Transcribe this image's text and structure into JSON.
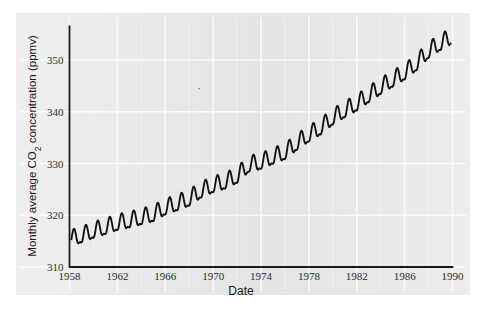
{
  "figure": {
    "background_color": "#e8e8e8",
    "page_color": "#ffffff",
    "line_color": "#111111",
    "grid_color": "#fbfbfb",
    "axis_color": "#1a1a1a"
  },
  "chart_data": {
    "type": "line",
    "title": "",
    "xlabel": "Date",
    "ylabel": "Monthly average CO₂ concentration (ppmv)",
    "ylabel_parts": {
      "pre": "Monthly average CO",
      "sub": "2",
      "post": " concentration (ppmv)"
    },
    "xlim": [
      1958,
      1990
    ],
    "ylim": [
      310,
      356
    ],
    "xticks": [
      1958,
      1962,
      1966,
      1970,
      1974,
      1978,
      1982,
      1986,
      1990
    ],
    "xtick_labels": [
      "1958",
      "1962",
      "1966",
      "1970",
      "1974",
      "1978",
      "1982",
      "1986",
      "1990"
    ],
    "yticks": [
      310,
      320,
      330,
      340,
      350
    ],
    "ytick_labels": [
      "310",
      "320",
      "330",
      "340",
      "350"
    ],
    "grid": true,
    "grid_style": "white gridlines at major ticks",
    "legend": "none",
    "series": [
      {
        "name": "Monthly average CO2 concentration (Mauna Loa)",
        "seasonal_amplitude_ppmv": 3.1,
        "annual_means": {
          "1958": 315.2,
          "1959": 315.9,
          "1960": 316.8,
          "1961": 317.5,
          "1962": 318.3,
          "1963": 318.8,
          "1964": 319.4,
          "1965": 320.0,
          "1966": 321.3,
          "1967": 322.1,
          "1968": 323.0,
          "1969": 324.6,
          "1970": 325.6,
          "1971": 326.3,
          "1972": 327.4,
          "1973": 329.6,
          "1974": 330.1,
          "1975": 331.1,
          "1976": 332.0,
          "1977": 333.8,
          "1978": 335.4,
          "1979": 336.8,
          "1980": 338.7,
          "1981": 340.1,
          "1982": 341.4,
          "1983": 343.0,
          "1984": 344.6,
          "1985": 346.0,
          "1986": 347.4,
          "1987": 349.2,
          "1988": 351.6,
          "1989": 353.1,
          "1990": 354.4
        },
        "start_value_ppmv": 315.2,
        "end_value_ppmv": 354.4,
        "peak_value_ppmv": 356.0,
        "min_value_ppmv": 312.9,
        "peak_month": "May",
        "trough_month": "October"
      }
    ]
  }
}
